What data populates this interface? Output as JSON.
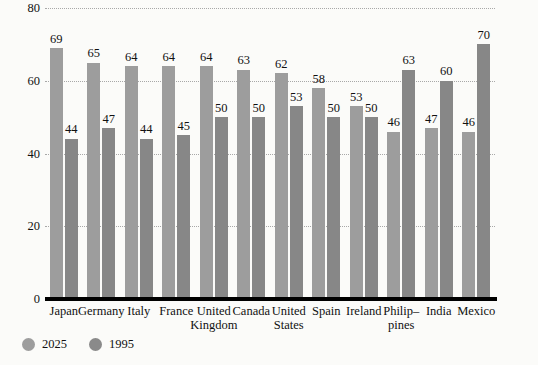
{
  "chart_data": {
    "type": "bar",
    "title": "",
    "xlabel": "",
    "ylabel": "",
    "ylim": [
      0,
      80
    ],
    "yticks": [
      0,
      20,
      40,
      60,
      80
    ],
    "grid": true,
    "grid_style": "dotted",
    "legend_position": "bottom-left",
    "categories": [
      "Japan",
      "Germany",
      "Italy",
      "France",
      "United Kingdom",
      "Canada",
      "United States",
      "Spain",
      "Ireland",
      "Philip–pines",
      "India",
      "Mexico"
    ],
    "category_lines": [
      [
        "Japan",
        ""
      ],
      [
        "Germany",
        ""
      ],
      [
        "Italy",
        ""
      ],
      [
        "France",
        ""
      ],
      [
        "United",
        "Kingdom"
      ],
      [
        "Canada",
        ""
      ],
      [
        "United",
        "States"
      ],
      [
        "Spain",
        ""
      ],
      [
        "Ireland",
        ""
      ],
      [
        "Philip–",
        "pines"
      ],
      [
        "India",
        ""
      ],
      [
        "Mexico",
        ""
      ]
    ],
    "series": [
      {
        "name": "2025",
        "color": "#9d9d9d",
        "values": [
          69,
          65,
          64,
          64,
          64,
          63,
          62,
          58,
          53,
          46,
          47,
          46
        ]
      },
      {
        "name": "1995",
        "color": "#878787",
        "values": [
          44,
          47,
          44,
          45,
          50,
          50,
          53,
          50,
          50,
          63,
          60,
          70
        ]
      }
    ]
  },
  "legend": {
    "items": [
      {
        "label": "2025",
        "color": "#9d9d9d",
        "marker": "circle"
      },
      {
        "label": "1995",
        "color": "#8a8a8a",
        "marker": "circle"
      }
    ]
  },
  "axis": {
    "y_tick_labels": [
      "80",
      "60",
      "40",
      "20",
      "0"
    ]
  }
}
